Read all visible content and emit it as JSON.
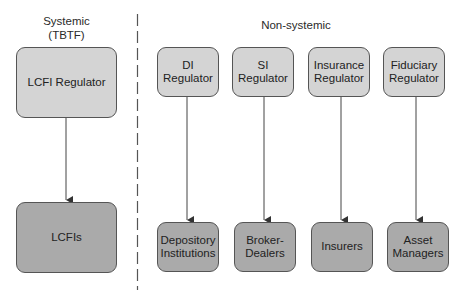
{
  "diagram": {
    "sections": {
      "systemic": {
        "title_line1": "Systemic",
        "title_line2": "(TBTF)"
      },
      "non_systemic": {
        "title": "Non-systemic"
      }
    },
    "divider": {
      "style": "dashed",
      "color": "#555555"
    },
    "colors": {
      "regulator_fill": "#d4d4d4",
      "entity_fill": "#aaaaaa",
      "border": "#555555",
      "arrow": "#444444"
    },
    "systemic_column": {
      "regulator": "LCFI Regulator",
      "entity": "LCFIs"
    },
    "non_systemic_columns": [
      {
        "regulator": "DI\nRegulator",
        "entity": "Depository\nInstitutions"
      },
      {
        "regulator": "SI\nRegulator",
        "entity": "Broker-\nDealers"
      },
      {
        "regulator": "Insurance\nRegulator",
        "entity": "Insurers"
      },
      {
        "regulator": "Fiduciary\nRegulator",
        "entity": "Asset\nManagers"
      }
    ],
    "edges": [
      {
        "from": "LCFI Regulator",
        "to": "LCFIs"
      },
      {
        "from": "DI Regulator",
        "to": "Depository Institutions"
      },
      {
        "from": "SI Regulator",
        "to": "Broker-Dealers"
      },
      {
        "from": "Insurance Regulator",
        "to": "Insurers"
      },
      {
        "from": "Fiduciary Regulator",
        "to": "Asset Managers"
      }
    ]
  }
}
